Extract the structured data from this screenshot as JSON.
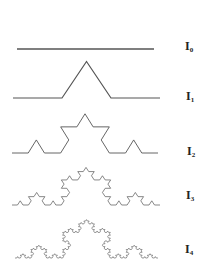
{
  "figure": {
    "stroke_color": "#555555",
    "background": "#ffffff",
    "curves": [
      {
        "name": "I0",
        "label_main": "I",
        "label_sub": "0",
        "iteration": 0,
        "x0": 17,
        "x1": 154,
        "baseline": 49,
        "vscale": 0.93,
        "stroke_width": 1.3,
        "label_x": 185,
        "label_y": 40
      },
      {
        "name": "I1",
        "label_main": "I",
        "label_sub": "1",
        "iteration": 1,
        "x0": 13,
        "x1": 160,
        "baseline": 98,
        "vscale": 0.86,
        "stroke_width": 1.2,
        "label_x": 186,
        "label_y": 90
      },
      {
        "name": "I2",
        "label_main": "I",
        "label_sub": "2",
        "iteration": 2,
        "x0": 12,
        "x1": 158,
        "baseline": 153,
        "vscale": 0.93,
        "stroke_width": 0.9,
        "label_x": 187,
        "label_y": 145
      },
      {
        "name": "I3",
        "label_main": "I",
        "label_sub": "3",
        "iteration": 3,
        "x0": 12,
        "x1": 160,
        "baseline": 205,
        "vscale": 0.88,
        "stroke_width": 0.7,
        "label_x": 186,
        "label_y": 189
      },
      {
        "name": "I4",
        "label_main": "I",
        "label_sub": "4",
        "iteration": 4,
        "x0": 15,
        "x1": 158,
        "baseline": 258,
        "vscale": 0.93,
        "stroke_width": 0.6,
        "label_x": 185,
        "label_y": 243
      }
    ]
  }
}
